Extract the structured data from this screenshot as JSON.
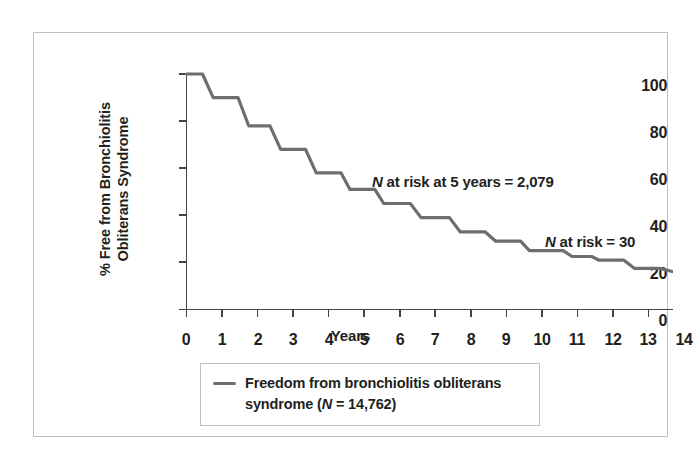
{
  "figure": {
    "accent_line_color": "#6e6e6e",
    "frame_color": "#bfbfbf",
    "text_color": "#231f20"
  },
  "axes": {
    "y_title_line1": "% Free from Bronchiolitis",
    "y_title_line2": "Obliterans Syndrome",
    "x_title": "Years",
    "y_ticks": [
      "0",
      "20",
      "40",
      "60",
      "80",
      "100"
    ],
    "x_ticks": [
      "0",
      "1",
      "2",
      "3",
      "4",
      "5",
      "6",
      "7",
      "8",
      "9",
      "10",
      "11",
      "12",
      "13",
      "14"
    ]
  },
  "annotations": {
    "five_year_italic": "N",
    "five_year_rest": " at risk at 5 years = 2,079",
    "final_italic": "N",
    "final_rest": " at risk = 30"
  },
  "legend": {
    "line1": "Freedom from bronchiolitis obliterans",
    "line2_pre": "syndrome (",
    "line2_italic": "N",
    "line2_post": " = 14,762)"
  },
  "chart_data": {
    "type": "line",
    "title": "",
    "subtitle": "",
    "xlabel": "Years",
    "ylabel": "% Free from Bronchiolitis Obliterans Syndrome",
    "xlim": [
      0,
      14
    ],
    "ylim": [
      0,
      100
    ],
    "xticks": [
      0,
      1,
      2,
      3,
      4,
      5,
      6,
      7,
      8,
      9,
      10,
      11,
      12,
      13,
      14
    ],
    "yticks": [
      0,
      20,
      40,
      60,
      80,
      100
    ],
    "grid": false,
    "legend_position": "below-plot",
    "step_style": "post",
    "series": [
      {
        "name": "Freedom from bronchiolitis obliterans syndrome (N = 14,762)",
        "color": "#6e6e6e",
        "n_total": 14762,
        "x": [
          0.0,
          0.45,
          0.75,
          1.45,
          1.75,
          2.35,
          2.65,
          3.35,
          3.65,
          4.35,
          4.6,
          5.3,
          5.55,
          6.3,
          6.6,
          7.4,
          7.7,
          8.4,
          8.7,
          9.4,
          9.65,
          10.6,
          10.85,
          11.4,
          11.6,
          12.3,
          12.6,
          13.3,
          14.0
        ],
        "y": [
          100,
          100,
          90,
          90,
          78,
          78,
          68,
          68,
          58,
          58,
          51,
          51,
          45,
          45,
          39,
          39,
          33,
          33,
          29,
          29,
          25,
          25,
          22.5,
          22.5,
          21,
          21,
          17.5,
          17.5,
          15
        ]
      }
    ],
    "annotations": [
      {
        "text": "N at risk at 5 years = 2,079",
        "x": 5.8,
        "y": 56,
        "n_at_risk": 2079,
        "at_year": 5
      },
      {
        "text": "N at risk = 30",
        "x": 10.8,
        "y": 31,
        "n_at_risk": 30
      }
    ]
  }
}
